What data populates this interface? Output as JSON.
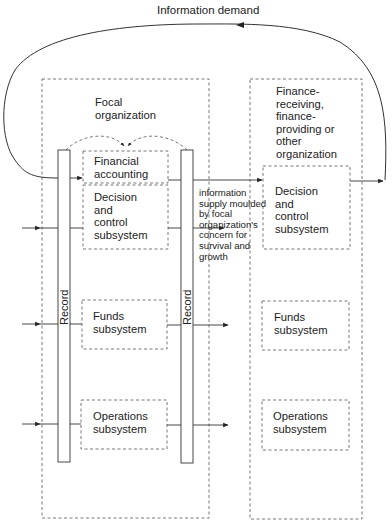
{
  "diagram": {
    "top_label": "Information demand",
    "focal_org": {
      "title": "Focal\norganization",
      "record_left": "Record",
      "record_right": "Record",
      "boxes": [
        {
          "id": "financial-accounting",
          "label": "Financial\naccounting"
        },
        {
          "id": "decision-control",
          "label": "Decision\nand\ncontrol\nsubsystem"
        },
        {
          "id": "funds",
          "label": "Funds\nsubsystem"
        },
        {
          "id": "operations",
          "label": "Operations\nsubsystem"
        }
      ]
    },
    "supply_note": "information\nsupply moulded\nby focal\norganization's\nconcern for\nsurvival and\ngrowth",
    "other_org": {
      "title": "Finance-\nreceiving,\nfinance-\nproviding or\nother\norganization",
      "boxes": [
        {
          "id": "decision-control",
          "label": "Decision\nand\ncontrol\nsubsystem"
        },
        {
          "id": "funds",
          "label": "Funds\nsubsystem"
        },
        {
          "id": "operations",
          "label": "Operations\nsubsystem"
        }
      ]
    },
    "colors": {
      "line": "#333333",
      "dashed": "#555555",
      "background": "#ffffff"
    }
  }
}
